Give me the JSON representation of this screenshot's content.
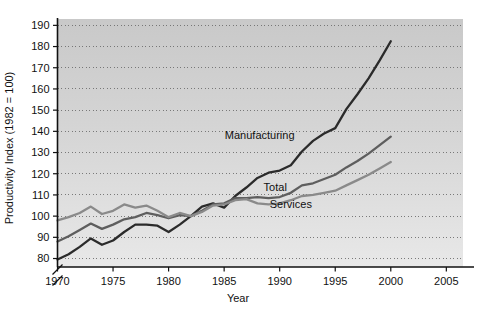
{
  "chart_data": {
    "type": "line",
    "title": "",
    "xlabel": "Year",
    "ylabel": "Productivity Index (1982 = 100)",
    "xlim": [
      1970,
      2006.5
    ],
    "ylim": [
      76,
      193
    ],
    "xticks": [
      1970,
      1975,
      1980,
      1985,
      1990,
      1995,
      2000,
      2005
    ],
    "xtick_labels": [
      "1970",
      "1975",
      "1980",
      "1985",
      "1990",
      "1995",
      "2000",
      "2005"
    ],
    "yticks": [
      80,
      90,
      100,
      110,
      120,
      130,
      140,
      150,
      160,
      170,
      180,
      190
    ],
    "ytick_labels": [
      "80",
      "90",
      "100",
      "110",
      "120",
      "130",
      "140",
      "150",
      "160",
      "170",
      "180",
      "190"
    ],
    "grid": true,
    "grid_style": "dotted-horizontal",
    "y_axis_break": true,
    "legend": "inline-labels",
    "plot_background": "gradient-gray",
    "x": [
      1970,
      1971,
      1972,
      1973,
      1974,
      1975,
      1976,
      1977,
      1978,
      1979,
      1980,
      1981,
      1982,
      1983,
      1984,
      1985,
      1986,
      1987,
      1988,
      1989,
      1990,
      1991,
      1992,
      1993,
      1994,
      1995,
      1996,
      1997,
      1998,
      1999,
      2000
    ],
    "series": [
      {
        "name": "Manufacturing",
        "color": "#2b2b2b",
        "label_x": 1988.2,
        "label_y": 136.5,
        "values": [
          79.5,
          82.0,
          85.5,
          89.5,
          86.5,
          88.5,
          92.5,
          96.0,
          96.0,
          95.5,
          92.5,
          96.0,
          100.0,
          104.5,
          106.0,
          104.0,
          109.5,
          113.5,
          118.0,
          120.5,
          121.5,
          124.0,
          130.5,
          135.5,
          139.0,
          141.5,
          150.5,
          157.5,
          165.0,
          173.5,
          182.5
        ]
      },
      {
        "name": "Total",
        "color": "#5e5e5e",
        "label_x": 1989.6,
        "label_y": 112.0,
        "values": [
          88.0,
          90.5,
          93.5,
          96.5,
          94.0,
          96.0,
          98.5,
          99.5,
          101.5,
          100.5,
          99.0,
          100.5,
          100.0,
          102.5,
          105.5,
          106.0,
          108.5,
          108.5,
          109.0,
          108.5,
          109.0,
          111.0,
          114.5,
          115.5,
          117.5,
          119.5,
          123.0,
          126.0,
          129.5,
          133.5,
          137.5
        ]
      },
      {
        "name": "Services",
        "color": "#8a8a8a",
        "label_x": 1991.0,
        "label_y": 104.0,
        "values": [
          98.0,
          99.5,
          101.5,
          104.5,
          101.0,
          102.5,
          105.5,
          104.0,
          105.0,
          102.5,
          99.5,
          101.5,
          100.0,
          102.0,
          105.0,
          105.5,
          107.5,
          108.0,
          106.0,
          105.5,
          106.0,
          107.5,
          109.5,
          110.0,
          111.0,
          112.0,
          114.5,
          117.0,
          119.5,
          122.5,
          125.5
        ]
      }
    ]
  }
}
